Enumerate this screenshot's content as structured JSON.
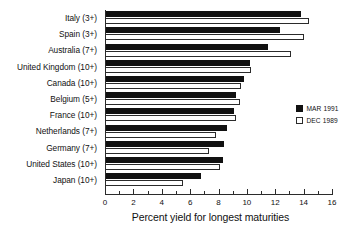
{
  "chart_data": {
    "type": "bar",
    "orientation": "horizontal",
    "title": "",
    "xlabel": "Percent yield for longest maturities",
    "ylabel": "",
    "xlim": [
      0,
      16
    ],
    "xticks": [
      0,
      2,
      4,
      6,
      8,
      10,
      12,
      14,
      16
    ],
    "xtick_labels": [
      "0",
      "2",
      "4",
      "6",
      "8",
      "10",
      "12",
      "14",
      "16"
    ],
    "minor_ticks": [
      1,
      3,
      5,
      7,
      9,
      11,
      13,
      15
    ],
    "grid": false,
    "legend_position": "right",
    "categories": [
      "Italy (3+)",
      "Spain (3+)",
      "Australia (7+)",
      "United Kingdom (10+)",
      "Canada (10+)",
      "Belgium (5+)",
      "France (10+)",
      "Netherlands (7+)",
      "Germany (7+)",
      "United States (10+)",
      "Japan (10+)"
    ],
    "series": [
      {
        "name": "MAR 1991",
        "color": "#111111",
        "style": "filled",
        "values": [
          13.8,
          12.3,
          11.5,
          10.2,
          9.8,
          9.2,
          9.1,
          8.6,
          8.4,
          8.3,
          6.8
        ]
      },
      {
        "name": "DEC 1989",
        "color": "#ffffff",
        "style": "hollow",
        "values": [
          14.4,
          14.0,
          13.1,
          10.3,
          9.6,
          9.5,
          9.2,
          7.8,
          7.3,
          8.1,
          5.5
        ]
      }
    ]
  },
  "legend": {
    "items": [
      {
        "label": "MAR 1991",
        "style": "filled"
      },
      {
        "label": "DEC 1989",
        "style": "hollow"
      }
    ]
  }
}
